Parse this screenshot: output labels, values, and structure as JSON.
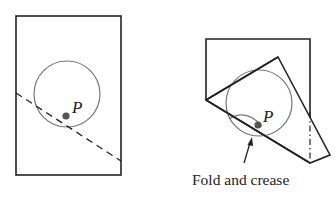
{
  "figures": [
    {
      "id": "flat-paper",
      "point_label": "P"
    },
    {
      "id": "folded-paper",
      "point_label": "P",
      "caption": "Fold and crease"
    }
  ],
  "colors": {
    "outline": "#222222",
    "circle": "#777777",
    "point": "#555555",
    "background": "#ffffff"
  }
}
